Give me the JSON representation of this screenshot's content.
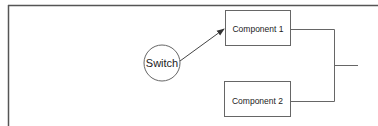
{
  "diagram": {
    "nodes": {
      "switch": {
        "label": "Switch"
      },
      "component1": {
        "label": "Component 1"
      },
      "component2": {
        "label": "Component 2"
      }
    },
    "edges": [
      {
        "from": "switch",
        "to": "component1",
        "arrow": true
      },
      {
        "from": "component1",
        "to": "output",
        "arrow": false
      },
      {
        "from": "component2",
        "to": "output",
        "arrow": false
      }
    ],
    "colors": {
      "stroke": "#555555",
      "background": "#ffffff"
    }
  }
}
